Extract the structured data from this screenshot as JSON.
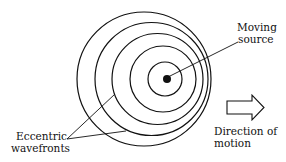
{
  "labels": {
    "moving_source": [
      "Moving",
      "source"
    ],
    "eccentric_wavefronts": [
      "Eccentric",
      "wavefronts"
    ],
    "direction_of_motion": [
      "Direction of",
      "motion"
    ]
  },
  "diagram": {
    "wavefront_count": 5,
    "stroke_color": "#111111",
    "background": "#ffffff",
    "arrow_direction": "right"
  }
}
